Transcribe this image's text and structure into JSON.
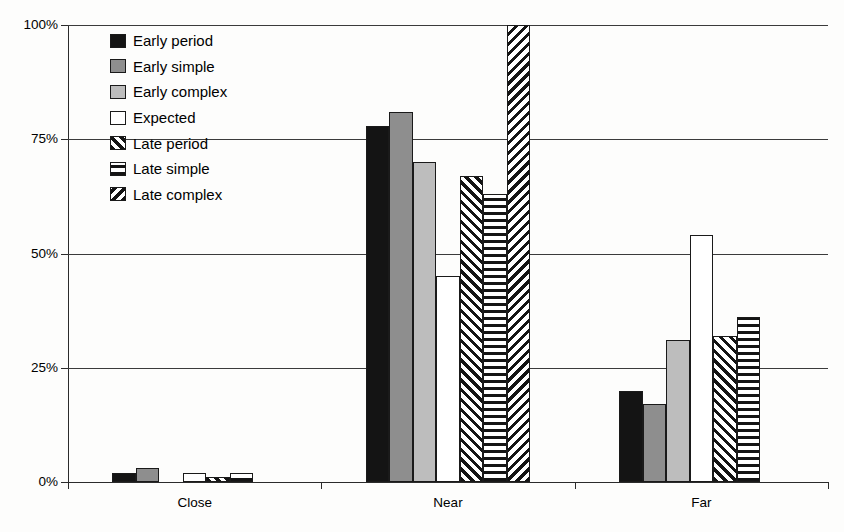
{
  "chart_data": {
    "type": "bar",
    "title": "",
    "subtitle": "",
    "xlabel": "",
    "ylabel": "",
    "grid": true,
    "legend_position": "inside-top-left",
    "categories": [
      "Close",
      "Near",
      "Far"
    ],
    "ylim": [
      0,
      100
    ],
    "yticks": [
      0,
      25,
      50,
      75,
      100
    ],
    "ytick_labels": [
      "0%",
      "25%",
      "50%",
      "75%",
      "100%"
    ],
    "value_suffix": "%",
    "series": [
      {
        "name": "Early period",
        "pattern": "solid-black",
        "color": "#141414",
        "values": [
          2,
          78,
          20
        ]
      },
      {
        "name": "Early simple",
        "pattern": "solid-dark-gray",
        "color": "#8e8e8e",
        "values": [
          3,
          81,
          17
        ]
      },
      {
        "name": "Early complex",
        "pattern": "solid-light-gray",
        "color": "#bdbdbd",
        "values": [
          0,
          70,
          31
        ]
      },
      {
        "name": "Expected",
        "pattern": "solid-white",
        "color": "#ffffff",
        "values": [
          2,
          45,
          54
        ]
      },
      {
        "name": "Late period",
        "pattern": "diagonal-forward",
        "color": "#ffffff",
        "values": [
          1,
          67,
          32
        ]
      },
      {
        "name": "Late simple",
        "pattern": "horizontal-lines",
        "color": "#ffffff",
        "values": [
          2,
          63,
          36
        ]
      },
      {
        "name": "Late complex",
        "pattern": "diagonal-back",
        "color": "#ffffff",
        "values": [
          0,
          100,
          0
        ]
      }
    ]
  },
  "legend": {
    "items": [
      {
        "label": "Early period",
        "swatch": "solid-black-swatch"
      },
      {
        "label": "Early simple",
        "swatch": "solid-dark-gray-swatch"
      },
      {
        "label": "Early complex",
        "swatch": "solid-light-gray-swatch"
      },
      {
        "label": "Expected",
        "swatch": "solid-white-swatch"
      },
      {
        "label": "Late period",
        "swatch": "diagonal-forward-swatch"
      },
      {
        "label": "Late simple",
        "swatch": "horizontal-lines-swatch"
      },
      {
        "label": "Late complex",
        "swatch": "diagonal-back-swatch"
      }
    ]
  },
  "axes": {
    "y_tick_labels": [
      "100%",
      "75%",
      "50%",
      "25%",
      "0%"
    ],
    "x_tick_labels": [
      "Close",
      "Near",
      "Far"
    ]
  },
  "colors": {
    "axis": "#2b2b2b",
    "grid": "#3b3b3b",
    "background": "#fdfdfc",
    "bar_outline": "#1a1a1a"
  }
}
